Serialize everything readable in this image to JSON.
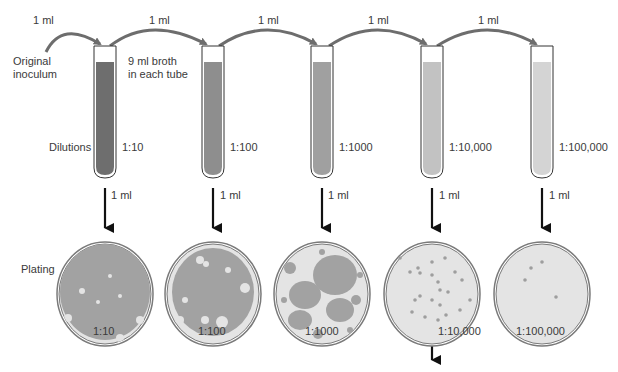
{
  "diagram": {
    "original_inoculum": [
      "Original",
      "inoculum"
    ],
    "broth_note": [
      "9 ml broth",
      "in each tube"
    ],
    "dilutions_label": "Dilutions",
    "plating_label": "Plating",
    "transfer_volume": "1 ml",
    "transfers": [
      "1 ml",
      "1 ml",
      "1 ml",
      "1 ml",
      "1 ml"
    ],
    "plating_volumes": [
      "1 ml",
      "1 ml",
      "1 ml",
      "1 ml",
      "1 ml"
    ],
    "tubes": [
      {
        "dilution": "1:10",
        "color": "#6e6e6e"
      },
      {
        "dilution": "1:100",
        "color": "#8e8e8e"
      },
      {
        "dilution": "1:1000",
        "color": "#a0a0a0"
      },
      {
        "dilution": "1:10,000",
        "color": "#c2c2c2"
      },
      {
        "dilution": "1:100,000",
        "color": "#d4d4d4"
      }
    ],
    "plates": [
      {
        "dilution": "1:10",
        "growth": "confluent"
      },
      {
        "dilution": "1:100",
        "growth": "near-confluent"
      },
      {
        "dilution": "1:1000",
        "growth": "dense colonies"
      },
      {
        "dilution": "1:10,000",
        "growth": "countable colonies"
      },
      {
        "dilution": "1:100,000",
        "growth": "few colonies"
      }
    ],
    "colors": {
      "arrow_curve": "#6d6d6d",
      "arrow_down": "#111111",
      "plate_rim": "#7a7a7a",
      "plate_agar": "#e4e4e4",
      "colony": "#9e9e9e"
    }
  }
}
